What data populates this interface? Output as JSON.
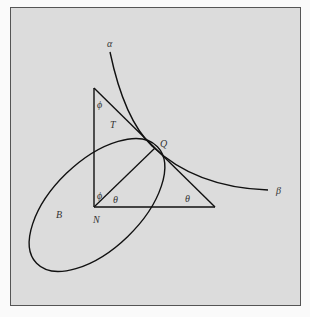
{
  "figure": {
    "labels": {
      "alpha": "α",
      "beta": "β",
      "phi_top": "ϕ",
      "T": "T",
      "Q": "Q",
      "phi_bottom": "ϕ",
      "theta_left": "θ",
      "theta_right": "θ",
      "N": "N",
      "B": "B"
    },
    "colors": {
      "background": "#dcdcdc",
      "stroke": "#111111",
      "border": "#555555"
    }
  }
}
